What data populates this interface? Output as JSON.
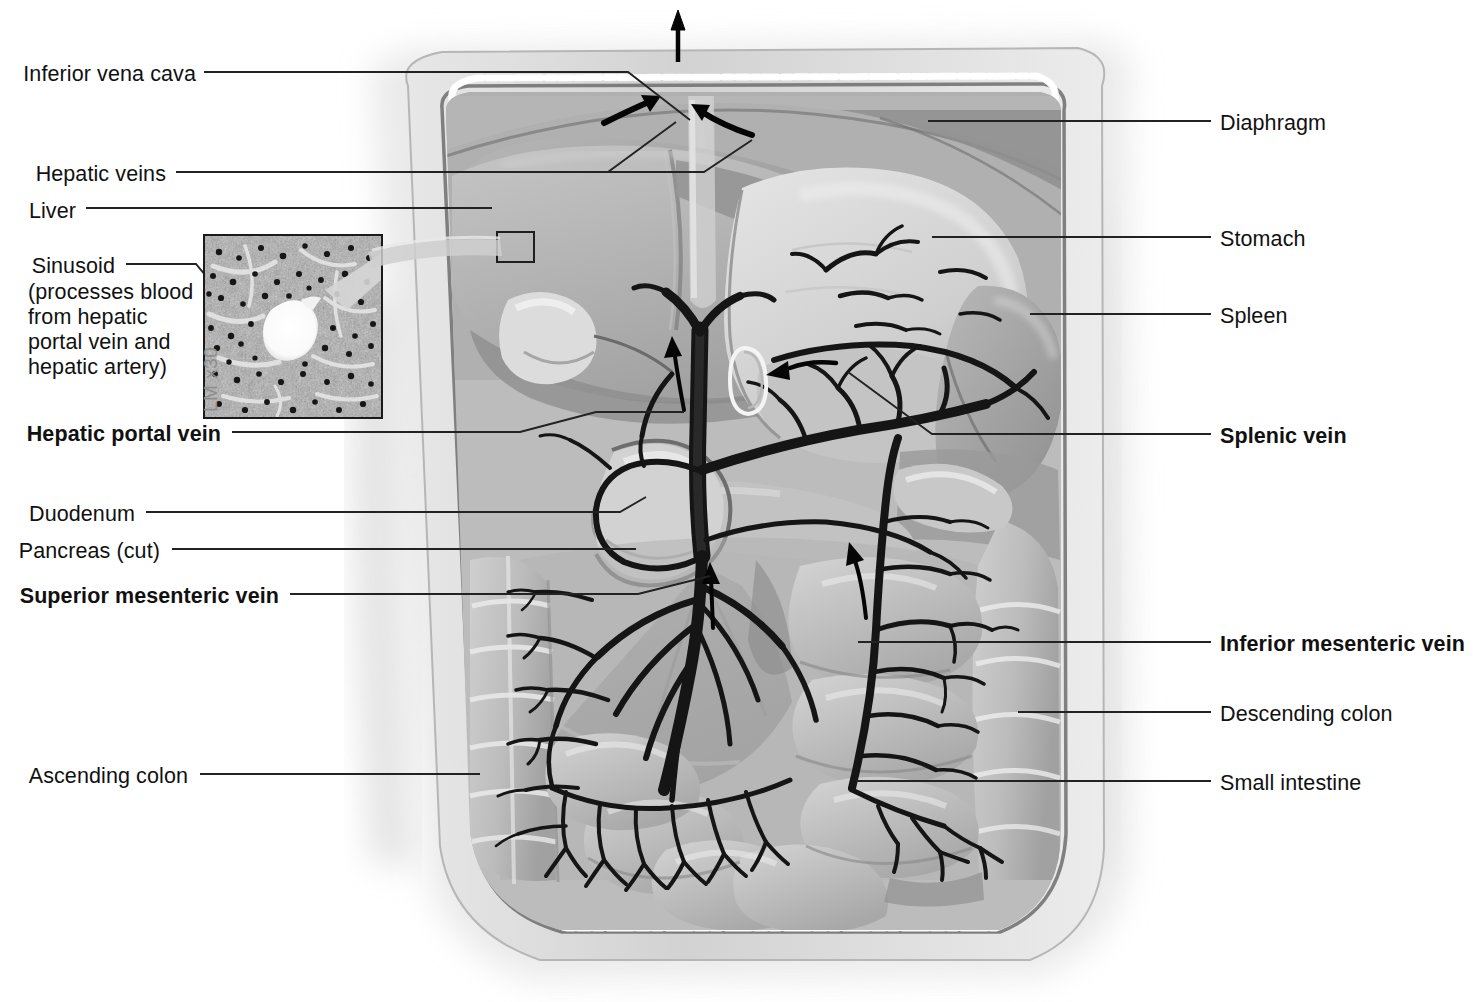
{
  "figure": {
    "background_color": "#ffffff",
    "ink_color": "#111111",
    "leader_color": "#222222"
  },
  "inset": {
    "name": "liver-sinusoid-micrograph",
    "magnification_label": "LM x30",
    "frame_color": "#1a1a1a"
  },
  "labels_left": [
    {
      "id": "inferior-vena-cava",
      "text": "Inferior vena cava",
      "bold": false,
      "x_right": 196,
      "y": 64
    },
    {
      "id": "hepatic-veins",
      "text": "Hepatic veins",
      "bold": false,
      "x_right": 166,
      "y": 164
    },
    {
      "id": "liver",
      "text": "Liver",
      "bold": false,
      "x_right": 76,
      "y": 201
    },
    {
      "id": "sinusoid",
      "text": "Sinusoid",
      "bold": false,
      "x_right": 115,
      "y": 256
    },
    {
      "id": "sinusoid-description",
      "text": "(processes blood from hepatic portal vein and hepatic artery)",
      "bold": false,
      "x_left": 28,
      "y": 282
    },
    {
      "id": "hepatic-portal-vein",
      "text": "Hepatic portal vein",
      "bold": true,
      "x_right": 221,
      "y": 424
    },
    {
      "id": "duodenum",
      "text": "Duodenum",
      "bold": false,
      "x_right": 135,
      "y": 504
    },
    {
      "id": "pancreas-cut",
      "text": "Pancreas (cut)",
      "bold": false,
      "x_right": 160,
      "y": 541
    },
    {
      "id": "superior-mesenteric-vein",
      "text": "Superior mesenteric vein",
      "bold": true,
      "x_right": 279,
      "y": 586
    },
    {
      "id": "ascending-colon",
      "text": "Ascending colon",
      "bold": false,
      "x_right": 188,
      "y": 766
    }
  ],
  "labels_right": [
    {
      "id": "diaphragm",
      "text": "Diaphragm",
      "bold": false,
      "x_left": 1220,
      "y": 113
    },
    {
      "id": "stomach",
      "text": "Stomach",
      "bold": false,
      "x_left": 1220,
      "y": 229
    },
    {
      "id": "spleen",
      "text": "Spleen",
      "bold": false,
      "x_left": 1220,
      "y": 306
    },
    {
      "id": "splenic-vein",
      "text": "Splenic vein",
      "bold": true,
      "x_left": 1220,
      "y": 426
    },
    {
      "id": "inferior-mesenteric-vein",
      "text": "Inferior mesenteric vein",
      "bold": true,
      "x_left": 1220,
      "y": 634
    },
    {
      "id": "descending-colon",
      "text": "Descending colon",
      "bold": false,
      "x_left": 1220,
      "y": 704
    },
    {
      "id": "small-intestine",
      "text": "Small intestine",
      "bold": false,
      "x_left": 1220,
      "y": 773
    }
  ],
  "flow_arrows": [
    {
      "id": "ivc-outflow-arrow",
      "direction": "up",
      "meaning": "blood leaving to heart"
    },
    {
      "id": "hepatic-vein-arrow-left",
      "direction": "up-right",
      "meaning": "hepatic vein flow into IVC"
    },
    {
      "id": "hepatic-vein-arrow-right",
      "direction": "up-left",
      "meaning": "hepatic vein flow into IVC"
    },
    {
      "id": "hepatic-portal-vein-arrow",
      "direction": "up",
      "meaning": "portal blood toward liver"
    },
    {
      "id": "splenic-vein-arrow",
      "direction": "left",
      "meaning": "splenic blood toward portal vein"
    },
    {
      "id": "superior-mesenteric-vein-arrow",
      "direction": "up",
      "meaning": "intestinal blood toward portal vein"
    },
    {
      "id": "inferior-mesenteric-vein-arrow",
      "direction": "up",
      "meaning": "colonic blood toward splenic vein"
    }
  ],
  "organs": [
    {
      "id": "body-wall",
      "label": "Abdominal body wall"
    },
    {
      "id": "diaphragm",
      "label": "Diaphragm"
    },
    {
      "id": "liver",
      "label": "Liver"
    },
    {
      "id": "gallbladder",
      "label": "Gallbladder"
    },
    {
      "id": "stomach",
      "label": "Stomach"
    },
    {
      "id": "spleen",
      "label": "Spleen"
    },
    {
      "id": "pancreas",
      "label": "Pancreas (cut)"
    },
    {
      "id": "duodenum",
      "label": "Duodenum"
    },
    {
      "id": "small-intestine",
      "label": "Small intestine"
    },
    {
      "id": "ascending-colon",
      "label": "Ascending colon"
    },
    {
      "id": "descending-colon",
      "label": "Descending colon"
    },
    {
      "id": "transverse-colon",
      "label": "Transverse colon"
    }
  ]
}
